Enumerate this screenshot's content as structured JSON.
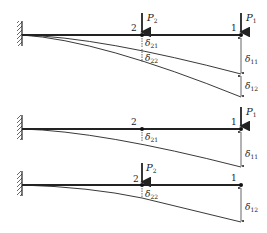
{
  "diagram": {
    "panels": [
      {
        "id": "combined",
        "nodes": [
          {
            "label": "2"
          },
          {
            "label": "1"
          }
        ],
        "loads": [
          {
            "label": "P",
            "sub": "2"
          },
          {
            "label": "P",
            "sub": "1"
          }
        ],
        "deflections": [
          {
            "label": "δ",
            "sub": "21"
          },
          {
            "label": "δ",
            "sub": "22"
          },
          {
            "label": "δ",
            "sub": "11"
          },
          {
            "label": "δ",
            "sub": "12"
          }
        ]
      },
      {
        "id": "load-p1",
        "nodes": [
          {
            "label": "2"
          },
          {
            "label": "1"
          }
        ],
        "loads": [
          {
            "label": "P",
            "sub": "1"
          }
        ],
        "deflections": [
          {
            "label": "δ",
            "sub": "21"
          },
          {
            "label": "δ",
            "sub": "11"
          }
        ]
      },
      {
        "id": "load-p2",
        "nodes": [
          {
            "label": "2"
          },
          {
            "label": "1"
          }
        ],
        "loads": [
          {
            "label": "P",
            "sub": "2"
          }
        ],
        "deflections": [
          {
            "label": "δ",
            "sub": "22"
          },
          {
            "label": "δ",
            "sub": "12"
          }
        ]
      }
    ],
    "colors": {
      "line": "#222222",
      "background": "#ffffff"
    }
  }
}
